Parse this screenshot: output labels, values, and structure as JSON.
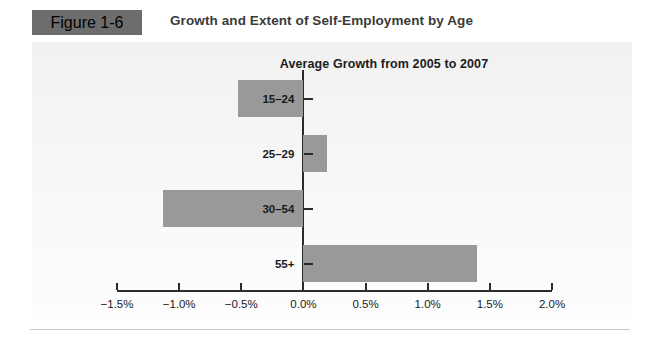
{
  "header": {
    "figure_number": "Figure 1-6",
    "title": "Growth and Extent of Self-Employment by Age",
    "box_color": "#6d6d6d"
  },
  "chart_data": {
    "type": "bar",
    "orientation": "horizontal",
    "title": "Average Growth from 2005 to 2007",
    "xlabel": "",
    "ylabel": "",
    "categories": [
      "15–24",
      "25–29",
      "30–54",
      "55+"
    ],
    "values": [
      -0.53,
      0.19,
      -1.13,
      1.4
    ],
    "value_unit": "%",
    "xlim": [
      -1.5,
      2.0
    ],
    "xticks": [
      -1.5,
      -1.0,
      -0.5,
      0.0,
      0.5,
      1.0,
      1.5,
      2.0
    ],
    "xtick_labels": [
      "−1.5%",
      "−1.0%",
      "−0.5%",
      "0.0%",
      "0.5%",
      "1.0%",
      "1.5%",
      "2.0%"
    ],
    "grid": false,
    "legend": null,
    "bar_color": "#999999",
    "axis_color": "#2b2b2b"
  }
}
